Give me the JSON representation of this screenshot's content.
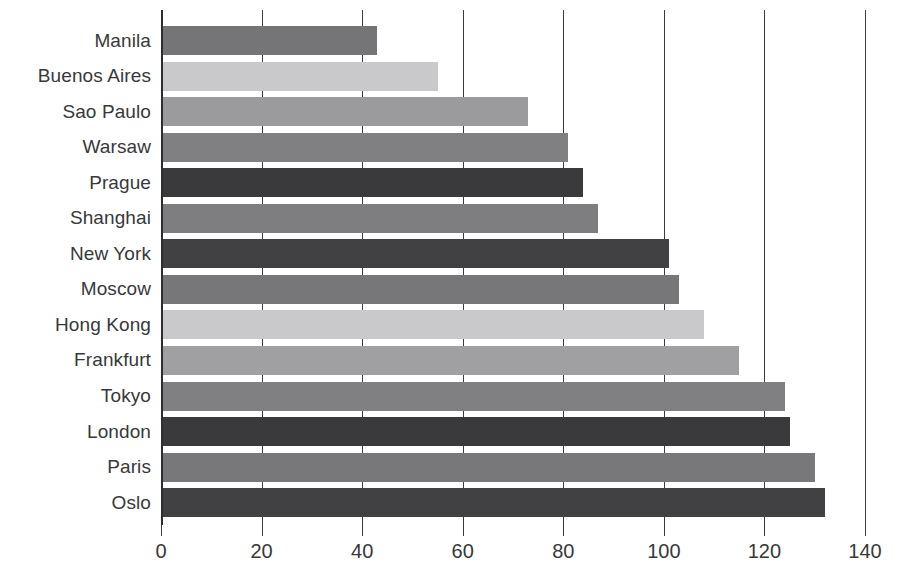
{
  "chart_data": {
    "type": "bar",
    "orientation": "horizontal",
    "title": "",
    "subtitle": "",
    "xlabel": "",
    "ylabel": "",
    "xlim": [
      0,
      140
    ],
    "ylim": null,
    "xticks": [
      "0",
      "20",
      "40",
      "60",
      "80",
      "100",
      "120",
      "140"
    ],
    "xtick_values": [
      0,
      20,
      40,
      60,
      80,
      100,
      120,
      140
    ],
    "grid": "vertical",
    "legend": null,
    "legend_position": "none",
    "categories": [
      "Manila",
      "Buenos Aires",
      "Sao Paulo",
      "Warsaw",
      "Prague",
      "Shanghai",
      "New York",
      "Moscow",
      "Hong Kong",
      "Frankfurt",
      "Tokyo",
      "London",
      "Paris",
      "Oslo"
    ],
    "values": [
      43,
      55,
      73,
      81,
      84,
      87,
      101,
      103,
      108,
      115,
      124,
      125,
      130,
      132
    ],
    "bar_colors": [
      "#757577",
      "#c9c9cb",
      "#9b9b9d",
      "#808082",
      "#3a3a3c",
      "#7e7e80",
      "#414143",
      "#77777a",
      "#c9c9cb",
      "#a0a0a2",
      "#808082",
      "#3a3a3c",
      "#78787b",
      "#414143"
    ],
    "axis_color": "#3b3b3d",
    "text_color": "#38383a",
    "background": "#ffffff"
  }
}
